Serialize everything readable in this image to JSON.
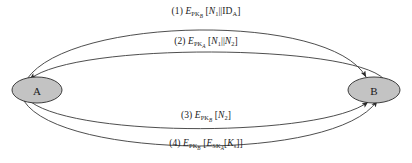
{
  "diagram": {
    "type": "protocol-message-sequence",
    "title": "",
    "nodes": [
      {
        "id": "A",
        "label": "A",
        "cx": 37,
        "cy": 90,
        "rx": 25,
        "ry": 13,
        "fill": "#c3c3c3",
        "stroke": "#2b2b2b"
      },
      {
        "id": "B",
        "label": "B",
        "cx": 374,
        "cy": 90,
        "rx": 26,
        "ry": 13,
        "fill": "#c3c3c3",
        "stroke": "#2b2b2b"
      }
    ],
    "edges": [
      {
        "number": "(1)",
        "from": "A",
        "to": "B",
        "direction": "A-to-B",
        "label_plain": "(1) E_PKb [N1 || ID_A]",
        "parts": {
          "index": "(1)",
          "cipher": "E",
          "cipher_sub": "PK",
          "cipher_sub_sub": "B",
          "open_bracket": "[",
          "arg1": "N",
          "arg1_sub": "1",
          "concat": "||",
          "arg2": "ID",
          "arg2_sub": "A",
          "close_bracket": "]"
        },
        "label_x": 206,
        "label_y": 6
      },
      {
        "number": "(2)",
        "from": "B",
        "to": "A",
        "direction": "B-to-A",
        "label_plain": "(2) E_PKa [N1 || N2]",
        "parts": {
          "index": "(2)",
          "cipher": "E",
          "cipher_sub": "PK",
          "cipher_sub_sub": "A",
          "open_bracket": "[",
          "arg1": "N",
          "arg1_sub": "1",
          "concat": "||",
          "arg2": "N",
          "arg2_sub": "2",
          "close_bracket": "]"
        },
        "label_x": 206,
        "label_y": 36
      },
      {
        "number": "(3)",
        "from": "A",
        "to": "B",
        "direction": "A-to-B",
        "label_plain": "(3) E_PKb [N2]",
        "parts": {
          "index": "(3)",
          "cipher": "E",
          "cipher_sub": "PK",
          "cipher_sub_sub": "B",
          "open_bracket": "[",
          "arg1": "N",
          "arg1_sub": "2",
          "close_bracket": "]"
        },
        "label_x": 206,
        "label_y": 110
      },
      {
        "number": "(4)",
        "from": "A",
        "to": "B",
        "direction": "A-to-B",
        "label_plain": "(4) E_PKb [E_SKa[Ks]]",
        "parts": {
          "index": "(4)",
          "cipher": "E",
          "cipher_sub": "PK",
          "cipher_sub_sub": "B",
          "open_bracket": "[",
          "inner_cipher": "E",
          "inner_cipher_sub": "SK",
          "inner_cipher_sub_sub": "A",
          "inner_open": "[",
          "inner_arg": "K",
          "inner_arg_sub": "s",
          "inner_close": "]",
          "close_bracket": "]"
        },
        "label_x": 206,
        "label_y": 138
      }
    ],
    "colors": {
      "background": "#ffffff",
      "node_fill": "#c3c3c3",
      "node_stroke": "#2b2b2b",
      "edge_stroke": "#3a3a3a",
      "text": "#1a1a1a"
    }
  }
}
